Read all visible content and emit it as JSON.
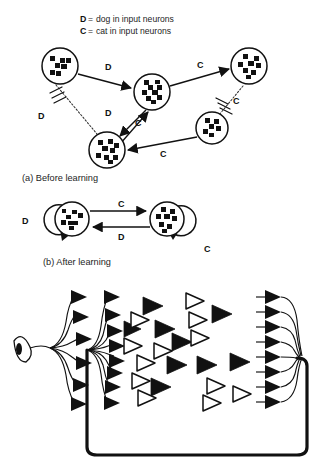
{
  "figure": {
    "background_color": "#ffffff",
    "ink_color": "#111111"
  },
  "legend": {
    "items": [
      {
        "key": "D",
        "equals": "=",
        "text": "dog in input neurons"
      },
      {
        "key": "C",
        "equals": "=",
        "text": "cat in input neurons"
      }
    ]
  },
  "panel_a": {
    "caption": "(a) Before learning",
    "nodes": [
      {
        "id": "n-top-left",
        "name": "neuron-top-left",
        "cx": 60,
        "cy": 66,
        "r": 18
      },
      {
        "id": "n-center",
        "name": "neuron-center",
        "cx": 152,
        "cy": 92,
        "r": 18
      },
      {
        "id": "n-top-right",
        "name": "neuron-top-right",
        "cx": 249,
        "cy": 66,
        "r": 18
      },
      {
        "id": "n-mid-right",
        "name": "neuron-mid-right",
        "cx": 212,
        "cy": 128,
        "r": 16
      },
      {
        "id": "n-bottom",
        "name": "neuron-bottom",
        "cx": 107,
        "cy": 150,
        "r": 18
      }
    ],
    "edge_labels": [
      {
        "text": "D",
        "x": 105,
        "y": 70,
        "name": "edge-label-d-top"
      },
      {
        "text": "C",
        "x": 197,
        "y": 68,
        "name": "edge-label-c-top"
      },
      {
        "text": "D",
        "x": 38,
        "y": 119,
        "name": "edge-label-d-left"
      },
      {
        "text": "D",
        "x": 105,
        "y": 116,
        "name": "edge-label-d-mid"
      },
      {
        "text": "C",
        "x": 135,
        "y": 126,
        "name": "edge-label-c-mid"
      },
      {
        "text": "C",
        "x": 233,
        "y": 104,
        "name": "edge-label-c-right"
      },
      {
        "text": "C",
        "x": 160,
        "y": 157,
        "name": "edge-label-c-bottom"
      }
    ]
  },
  "panel_b": {
    "caption": "(b) After learning",
    "nodes": [
      {
        "id": "b-left",
        "name": "neuron-left",
        "cx": 72,
        "cy": 219,
        "r": 17
      },
      {
        "id": "b-right",
        "name": "neuron-right",
        "cx": 167,
        "cy": 219,
        "r": 17
      }
    ],
    "edge_labels": [
      {
        "text": "C",
        "x": 118,
        "y": 207,
        "name": "edge-label-c-forward"
      },
      {
        "text": "D",
        "x": 118,
        "y": 240,
        "name": "edge-label-d-backward"
      },
      {
        "text": "D",
        "x": 22,
        "y": 224,
        "name": "self-loop-label-d"
      },
      {
        "text": "C",
        "x": 204,
        "y": 252,
        "name": "self-loop-label-c"
      }
    ]
  },
  "panel_c": {
    "name": "network-architecture-diagram",
    "elements": {
      "eye": "eye-icon",
      "input_arrows": 6,
      "second_layer_arrows": 9,
      "output_arrows": 9,
      "feedback_loop": "recurrent-feedback-path"
    },
    "triangles": {
      "filled_count": 13,
      "open_count": 16,
      "filled_color": "#111111",
      "open_color": "#ffffff"
    }
  }
}
